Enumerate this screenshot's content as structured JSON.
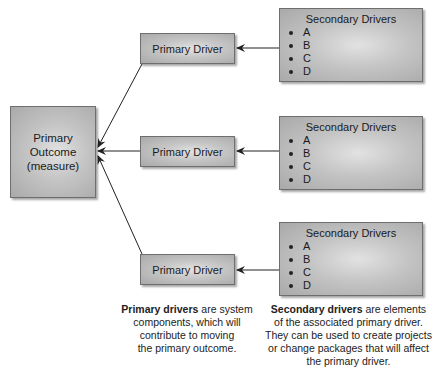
{
  "diagram": {
    "type": "driver-diagram",
    "primary_outcome": {
      "line1": "Primary",
      "line2": "Outcome",
      "line3": "(measure)"
    },
    "primary_drivers": [
      {
        "label": "Primary Driver"
      },
      {
        "label": "Primary Driver"
      },
      {
        "label": "Primary Driver"
      }
    ],
    "secondary_drivers": [
      {
        "title": "Secondary Drivers",
        "items": [
          "A",
          "B",
          "C",
          "D"
        ]
      },
      {
        "title": "Secondary Drivers",
        "items": [
          "A",
          "B",
          "C",
          "D"
        ]
      },
      {
        "title": "Secondary Drivers",
        "items": [
          "A",
          "B",
          "C",
          "D"
        ]
      }
    ],
    "captions": {
      "primary": {
        "bold": "Primary drivers",
        "rest1": " are system",
        "line2": "components, which will",
        "line3": "contribute to moving",
        "line4": "the primary outcome."
      },
      "secondary": {
        "bold": "Secondary drivers",
        "rest1": " are elements",
        "line2": "of the associated primary driver.",
        "line3": "They can be used to create projects",
        "line4": "or change packages that will affect",
        "line5": "the primary driver."
      }
    },
    "colors": {
      "box_fill": "#c4c4c4",
      "box_border": "#6e6e6e",
      "arrow": "#222222"
    }
  }
}
